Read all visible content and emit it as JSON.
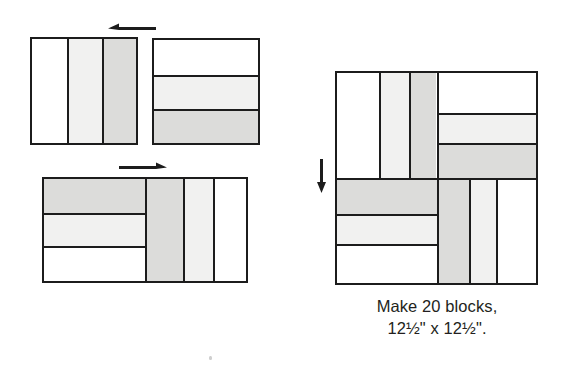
{
  "page": {
    "width": 572,
    "height": 375,
    "background": "#ffffff"
  },
  "colors": {
    "outline": "#1c1c1c",
    "fabric_white": "#ffffff",
    "fabric_light": "#f1f1f0",
    "fabric_medium": "#dcdcda",
    "text": "#231f20"
  },
  "units": [
    {
      "id": "top-left-unit",
      "name": "vertical-strip-unit",
      "orientation": "vertical",
      "strips": [
        {
          "fabric": "white",
          "width_pct": 34
        },
        {
          "fabric": "light",
          "width_pct": 33
        },
        {
          "fabric": "medium",
          "width_pct": 33
        }
      ]
    },
    {
      "id": "top-right-unit",
      "name": "horizontal-strip-unit",
      "orientation": "horizontal",
      "strips": [
        {
          "fabric": "white",
          "height_pct": 34
        },
        {
          "fabric": "light",
          "height_pct": 33
        },
        {
          "fabric": "medium",
          "height_pct": 33
        }
      ]
    },
    {
      "id": "bottom-unit-left-half",
      "name": "horizontal-strip-unit-reversed",
      "orientation": "horizontal",
      "strips": [
        {
          "fabric": "medium",
          "height_pct": 33
        },
        {
          "fabric": "light",
          "height_pct": 33
        },
        {
          "fabric": "white",
          "height_pct": 34
        }
      ]
    },
    {
      "id": "bottom-unit-right-half",
      "name": "vertical-strip-unit-reversed",
      "orientation": "vertical",
      "strips": [
        {
          "fabric": "medium",
          "width_pct": 33
        },
        {
          "fabric": "light",
          "width_pct": 33
        },
        {
          "fabric": "white",
          "width_pct": 34
        }
      ]
    }
  ],
  "big_block": {
    "name": "finished-pinwheel-block",
    "quadrants": [
      {
        "position": "top-left",
        "orientation": "vertical",
        "strips": [
          {
            "fabric": "white"
          },
          {
            "fabric": "light"
          },
          {
            "fabric": "medium"
          }
        ]
      },
      {
        "position": "top-right",
        "orientation": "horizontal",
        "strips": [
          {
            "fabric": "white"
          },
          {
            "fabric": "light"
          },
          {
            "fabric": "medium"
          }
        ]
      },
      {
        "position": "bottom-left",
        "orientation": "horizontal",
        "strips": [
          {
            "fabric": "medium"
          },
          {
            "fabric": "light"
          },
          {
            "fabric": "white"
          }
        ]
      },
      {
        "position": "bottom-right",
        "orientation": "vertical",
        "strips": [
          {
            "fabric": "medium"
          },
          {
            "fabric": "light"
          },
          {
            "fabric": "white"
          }
        ]
      }
    ]
  },
  "arrows": [
    {
      "id": "arrow-top",
      "direction": "left",
      "label": "press seams left"
    },
    {
      "id": "arrow-middle",
      "direction": "right",
      "label": "press seams right"
    },
    {
      "id": "arrow-block",
      "direction": "down",
      "label": "press seams down"
    }
  ],
  "caption": {
    "line1": "Make 20 blocks,",
    "line2": "12½\" x 12½\"."
  }
}
